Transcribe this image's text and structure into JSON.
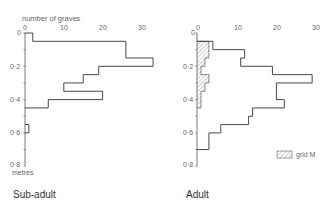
{
  "chart_data": [
    {
      "type": "bar",
      "orientation": "horizontal-step",
      "title": "Sub-adult",
      "xlabel": "number of graves",
      "ylabel": "metres",
      "xticks": [
        0,
        10,
        20,
        30
      ],
      "yticks": [
        "0",
        "0·2",
        "0·4",
        "0·6",
        "0·8"
      ],
      "xlim": [
        0,
        33
      ],
      "ylim": [
        0,
        0.8
      ],
      "bin_width_m": 0.05,
      "bins": [
        {
          "from": 0.0,
          "to": 0.05,
          "count": 2
        },
        {
          "from": 0.05,
          "to": 0.15,
          "count": 26
        },
        {
          "from": 0.15,
          "to": 0.2,
          "count": 33
        },
        {
          "from": 0.2,
          "to": 0.25,
          "count": 19
        },
        {
          "from": 0.25,
          "to": 0.3,
          "count": 15
        },
        {
          "from": 0.3,
          "to": 0.35,
          "count": 10
        },
        {
          "from": 0.35,
          "to": 0.4,
          "count": 20
        },
        {
          "from": 0.4,
          "to": 0.45,
          "count": 6
        },
        {
          "from": 0.55,
          "to": 0.6,
          "count": 1
        }
      ]
    },
    {
      "type": "bar",
      "orientation": "horizontal-step",
      "title": "Adult",
      "xlabel": "number of graves",
      "ylabel": "metres",
      "xticks": [
        0,
        10,
        20,
        30
      ],
      "yticks": [
        "0",
        "0·2",
        "0·4",
        "0·6",
        "0·8"
      ],
      "xlim": [
        0,
        30
      ],
      "ylim": [
        0,
        0.8
      ],
      "bin_width_m": 0.05,
      "legend": [
        {
          "label": "grid M",
          "pattern": "hatched"
        }
      ],
      "series": [
        {
          "name": "All adult",
          "bins": [
            {
              "from": 0.05,
              "to": 0.1,
              "count": 4
            },
            {
              "from": 0.1,
              "to": 0.15,
              "count": 12
            },
            {
              "from": 0.15,
              "to": 0.2,
              "count": 11
            },
            {
              "from": 0.2,
              "to": 0.25,
              "count": 19
            },
            {
              "from": 0.25,
              "to": 0.3,
              "count": 29
            },
            {
              "from": 0.3,
              "to": 0.4,
              "count": 20
            },
            {
              "from": 0.4,
              "to": 0.45,
              "count": 22
            },
            {
              "from": 0.45,
              "to": 0.5,
              "count": 14
            },
            {
              "from": 0.5,
              "to": 0.55,
              "count": 13
            },
            {
              "from": 0.55,
              "to": 0.6,
              "count": 6
            },
            {
              "from": 0.6,
              "to": 0.7,
              "count": 3
            }
          ]
        },
        {
          "name": "grid M",
          "bins": [
            {
              "from": 0.05,
              "to": 0.1,
              "count": 3
            },
            {
              "from": 0.1,
              "to": 0.15,
              "count": 3
            },
            {
              "from": 0.15,
              "to": 0.2,
              "count": 2
            },
            {
              "from": 0.2,
              "to": 0.25,
              "count": 1
            },
            {
              "from": 0.25,
              "to": 0.3,
              "count": 3
            },
            {
              "from": 0.3,
              "to": 0.35,
              "count": 2
            },
            {
              "from": 0.35,
              "to": 0.4,
              "count": 1
            },
            {
              "from": 0.4,
              "to": 0.45,
              "count": 1
            }
          ]
        }
      ]
    }
  ],
  "labels": {
    "x_axis_title": "number of graves",
    "y_units": "metres",
    "left_caption": "Sub-adult",
    "right_caption": "Adult",
    "legend_label": "grid M",
    "xticks": [
      "0",
      "10",
      "20",
      "30"
    ],
    "yticks": [
      "0",
      "0·2",
      "0·4",
      "0·6",
      "0·8"
    ]
  }
}
